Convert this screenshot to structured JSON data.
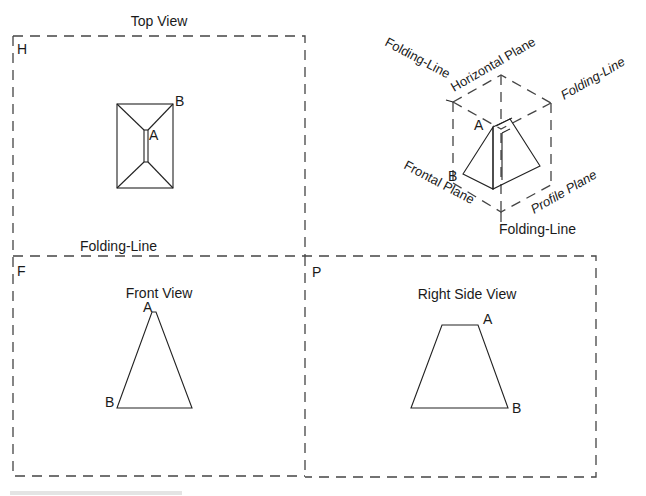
{
  "views": {
    "top": {
      "title": "Top View",
      "plane_letter": "H",
      "point_a": "A",
      "point_b": "B"
    },
    "front": {
      "title": "Front View",
      "plane_letter": "F",
      "point_a": "A",
      "point_b": "B"
    },
    "right": {
      "title": "Right Side View",
      "plane_letter": "P",
      "point_a": "A",
      "point_b": "B"
    }
  },
  "folding_line_label": "Folding-Line",
  "isometric": {
    "horizontal_plane": "Horizontal Plane",
    "frontal_plane": "Frontal Plane",
    "profile_plane": "Profile Plane",
    "folding_line_left": "Folding-Line",
    "folding_line_right": "Folding-Line",
    "folding_line_bottom": "Folding-Line",
    "point_a": "A",
    "point_b": "B"
  },
  "colors": {
    "line": "#222222",
    "dashed": "#444444",
    "background": "#ffffff"
  }
}
